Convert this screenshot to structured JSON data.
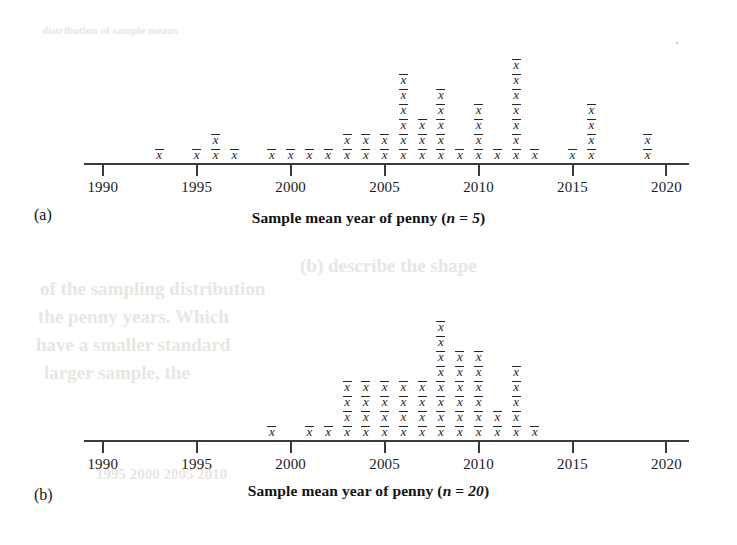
{
  "figure": {
    "background": "#ffffff",
    "axis_color": "#3a3a3a",
    "mark_color": "#26262b",
    "mark_glyph": "x",
    "mark_semantic": "x-bar-sample-mean-symbol"
  },
  "bleed_text": [
    {
      "text": "distribution of sample means",
      "x": 42,
      "y": 24,
      "size": 11
    },
    {
      "text": "(b) describe the shape",
      "x": 300,
      "y": 255,
      "size": 19
    },
    {
      "text": "of the sampling distribution",
      "x": 40,
      "y": 278,
      "size": 19
    },
    {
      "text": "the penny years. Which",
      "x": 38,
      "y": 306,
      "size": 19
    },
    {
      "text": "have a smaller standard",
      "x": 36,
      "y": 334,
      "size": 19
    },
    {
      "text": "larger sample, the",
      "x": 44,
      "y": 362,
      "size": 19
    },
    {
      "text": "1995        2000        2005        2010",
      "x": 96,
      "y": 466,
      "size": 15
    }
  ],
  "panels": [
    {
      "label": "(a)",
      "caption_prefix": "Sample mean year of penny (",
      "caption_n_var": "n",
      "caption_equals": " = ",
      "caption_n_value": "5",
      "caption_suffix": ")",
      "caption_full": "Sample mean year of penny (n = 5)",
      "axis": {
        "ticks": [
          1990,
          1995,
          2000,
          2005,
          2010,
          2015,
          2020
        ],
        "tick_labels": [
          "1990",
          "1995",
          "2000",
          "2005",
          "2010",
          "2015",
          "2020"
        ],
        "xmin": 1989.0,
        "xmax": 2021.2
      },
      "chart_data": {
        "type": "dotplot",
        "title": "Sample mean year of penny (n = 5)",
        "xlabel": "Sample mean year of penny (n = 5)",
        "ylabel": "",
        "xlim": [
          1989.0,
          2021.2
        ],
        "grid": false,
        "legend": "none",
        "categories": [
          1993,
          1995,
          1996,
          1997,
          1999,
          2000,
          2001,
          2002,
          2003,
          2004,
          2005,
          2006,
          2007,
          2008,
          2009,
          2010,
          2011,
          2012,
          2013,
          2015,
          2016,
          2019
        ],
        "values": [
          1,
          1,
          2,
          1,
          1,
          1,
          1,
          1,
          2,
          2,
          2,
          6,
          3,
          5,
          1,
          4,
          1,
          7,
          1,
          1,
          4,
          2
        ],
        "total_marks": 50
      }
    },
    {
      "label": "(b)",
      "caption_prefix": "Sample mean year of penny (",
      "caption_n_var": "n",
      "caption_equals": " = ",
      "caption_n_value": "20",
      "caption_suffix": ")",
      "caption_full": "Sample mean year of penny (n = 20)",
      "axis": {
        "ticks": [
          1990,
          1995,
          2000,
          2005,
          2010,
          2015,
          2020
        ],
        "tick_labels": [
          "1990",
          "1995",
          "2000",
          "2005",
          "2010",
          "2015",
          "2020"
        ],
        "xmin": 1989.0,
        "xmax": 2021.2
      },
      "chart_data": {
        "type": "dotplot",
        "title": "Sample mean year of penny (n = 20)",
        "xlabel": "Sample mean year of penny (n = 20)",
        "ylabel": "",
        "xlim": [
          1989.0,
          2021.2
        ],
        "grid": false,
        "legend": "none",
        "categories": [
          1999,
          2001,
          2002,
          2003,
          2004,
          2005,
          2006,
          2007,
          2008,
          2009,
          2010,
          2011,
          2012,
          2013
        ],
        "values": [
          1,
          1,
          1,
          4,
          4,
          4,
          4,
          4,
          8,
          6,
          6,
          2,
          5,
          1
        ],
        "total_marks": 51
      }
    }
  ]
}
